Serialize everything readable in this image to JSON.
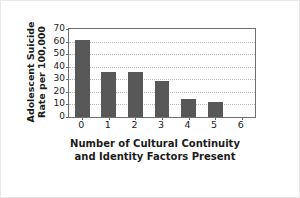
{
  "chart_data": {
    "type": "bar",
    "title": "",
    "xlabel": "Number of Cultural Continuity and Identity Factors Present",
    "xlabel_lines": [
      "Number of Cultural Continuity",
      "and Identity Factors Present"
    ],
    "ylabel": "Adolescent Suicide Rate per 100,000",
    "ylabel_lines": [
      "Adolescent Suicide",
      "Rate per 100,000"
    ],
    "categories": [
      "0",
      "1",
      "2",
      "3",
      "4",
      "5",
      "6"
    ],
    "values": [
      61,
      36,
      36,
      29,
      14,
      12,
      0
    ],
    "xticks": [
      "0",
      "1",
      "2",
      "3",
      "4",
      "5",
      "6"
    ],
    "yticks": [
      "0",
      "10",
      "20",
      "30",
      "40",
      "50",
      "60",
      "70"
    ],
    "ytick_values": [
      0,
      10,
      20,
      30,
      40,
      50,
      60,
      70
    ],
    "ylim": [
      0,
      70
    ],
    "grid": "horizontal-dotted",
    "legend": "none",
    "bar_color": "#585858",
    "frame_color": "#6e6e6e",
    "grid_color": "#b9b9b9",
    "text_color": "#1b1b1b",
    "background": "#ffffff"
  }
}
